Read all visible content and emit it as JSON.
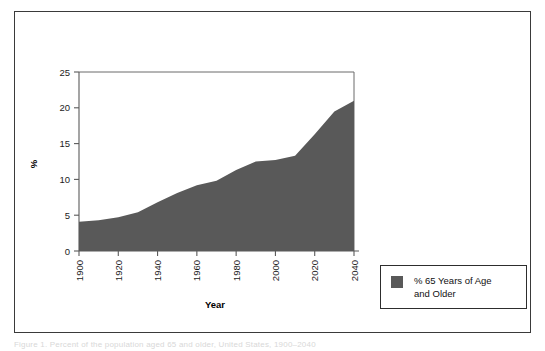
{
  "figure": {
    "frame_color": "#3a3a3a",
    "background": "#ffffff"
  },
  "chart_data": {
    "type": "area",
    "title": "",
    "subtitle": "",
    "xlabel": "Year",
    "ylabel": "%",
    "xlim": [
      1900,
      2040
    ],
    "ylim": [
      0,
      25
    ],
    "xticks": [
      1900,
      1920,
      1940,
      1960,
      1980,
      2000,
      2020,
      2040
    ],
    "xtick_labels": [
      "1900",
      "1920",
      "1940",
      "1960",
      "1980",
      "2000",
      "2020",
      "2040"
    ],
    "yticks": [
      0,
      5,
      10,
      15,
      20,
      25
    ],
    "ytick_labels": [
      "0",
      "5",
      "10",
      "15",
      "20",
      "25"
    ],
    "grid": false,
    "legend_position": "right-outside",
    "series": [
      {
        "name": "% 65 Years of Age and Older",
        "color": "#595959",
        "x": [
          1900,
          1910,
          1920,
          1930,
          1940,
          1950,
          1960,
          1970,
          1980,
          1990,
          2000,
          2010,
          2020,
          2030,
          2040
        ],
        "values": [
          4.1,
          4.3,
          4.7,
          5.4,
          6.8,
          8.1,
          9.2,
          9.8,
          11.3,
          12.5,
          12.7,
          13.3,
          16.3,
          19.5,
          21.0
        ]
      }
    ]
  },
  "legend": {
    "label": "% 65 Years of Age\nand Older",
    "swatch_color": "#595959"
  },
  "axes": {
    "x_title": "Year",
    "y_title": "%"
  },
  "bottom_caption": {
    "text": "Figure 1. Percent of the population aged 65 and older, United States, 1900–2040"
  }
}
